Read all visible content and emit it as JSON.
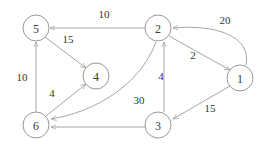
{
  "figure": {
    "type": "directed-weighted-graph",
    "background_color": "#ffffff",
    "node_stroke_color": "#9a9a9a",
    "edge_stroke_color": "#a6a6a6",
    "label_color": "#333333"
  },
  "nodes": [
    {
      "id": "5",
      "label": "5",
      "cx": 36,
      "cy": 28,
      "r": 13
    },
    {
      "id": "2",
      "label": "2",
      "cx": 158,
      "cy": 28,
      "r": 13
    },
    {
      "id": "1",
      "label": "1",
      "cx": 240,
      "cy": 78,
      "r": 13
    },
    {
      "id": "4",
      "label": "4",
      "cx": 96,
      "cy": 76,
      "r": 13
    },
    {
      "id": "6",
      "label": "6",
      "cx": 36,
      "cy": 125,
      "r": 13
    },
    {
      "id": "3",
      "label": "3",
      "cx": 158,
      "cy": 125,
      "r": 13
    }
  ],
  "edges": [
    {
      "id": "e-2-5",
      "from": "2",
      "to": "5",
      "weight": "10",
      "label_x": 104,
      "label_y": 14,
      "path": "M 145 28 L 50 28"
    },
    {
      "id": "e-5-4",
      "from": "5",
      "to": "4",
      "weight": "15",
      "label_x": 68,
      "label_y": 39,
      "path": "M 45 37 L 86 68"
    },
    {
      "id": "e-6-5",
      "from": "6",
      "to": "5",
      "weight": "10",
      "label_x": 22,
      "label_y": 77,
      "path": "M 36 112 L 36 42"
    },
    {
      "id": "e-6-4",
      "from": "6",
      "to": "4",
      "weight": "4",
      "label_x": 52,
      "label_y": 93,
      "path": "M 46 116 L 86 84"
    },
    {
      "id": "e-3-6",
      "from": "3",
      "to": "6",
      "weight": "30",
      "label_x": 139,
      "label_y": 100,
      "path": "M 156 42 C 140 85 95 112 51 119"
    },
    {
      "id": "e-3-6b",
      "from": "3",
      "to": "6",
      "weight": "",
      "label_x": 97,
      "label_y": 133,
      "path": "M 145 127 L 51 127"
    },
    {
      "id": "e-3-2",
      "from": "3",
      "to": "2",
      "weight": "4",
      "label_x": 161,
      "label_y": 76,
      "path": "M 164 112 L 164 42"
    },
    {
      "id": "e-2-1",
      "from": "2",
      "to": "1",
      "weight": "2",
      "label_x": 193,
      "label_y": 55,
      "path": "M 169 36 L 230 70"
    },
    {
      "id": "e-1-2",
      "from": "1",
      "to": "2",
      "weight": "20",
      "label_x": 225,
      "label_y": 20,
      "path": "M 246 65 C 252 36 215 24 173 28"
    },
    {
      "id": "e-1-3",
      "from": "1",
      "to": "3",
      "weight": "15",
      "label_x": 210,
      "label_y": 108,
      "path": "M 230 86 L 173 119"
    }
  ]
}
